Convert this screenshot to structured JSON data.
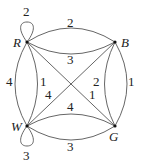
{
  "diagram": {
    "type": "weighted multigraph",
    "vertices": [
      {
        "id": "R",
        "label": "R"
      },
      {
        "id": "B",
        "label": "B"
      },
      {
        "id": "W",
        "label": "W"
      },
      {
        "id": "G",
        "label": "G"
      }
    ],
    "edges": [
      {
        "from": "R",
        "to": "R",
        "weight": "2",
        "kind": "loop"
      },
      {
        "from": "R",
        "to": "B",
        "weight": "2",
        "kind": "upper-arc"
      },
      {
        "from": "R",
        "to": "B",
        "weight": "3",
        "kind": "lower-arc"
      },
      {
        "from": "R",
        "to": "W",
        "weight": "4",
        "kind": "outer-arc"
      },
      {
        "from": "R",
        "to": "W",
        "weight": "1",
        "kind": "inner-arc"
      },
      {
        "from": "R",
        "to": "G",
        "weight": "1",
        "kind": "diagonal"
      },
      {
        "from": "W",
        "to": "B",
        "weight": "4",
        "kind": "diagonal"
      },
      {
        "from": "B",
        "to": "G",
        "weight": "2",
        "kind": "inner-arc"
      },
      {
        "from": "B",
        "to": "G",
        "weight": "1",
        "kind": "outer-arc"
      },
      {
        "from": "W",
        "to": "G",
        "weight": "4",
        "kind": "upper-arc"
      },
      {
        "from": "W",
        "to": "G",
        "weight": "3",
        "kind": "lower-arc"
      },
      {
        "from": "W",
        "to": "W",
        "weight": "3",
        "kind": "loop"
      }
    ]
  }
}
